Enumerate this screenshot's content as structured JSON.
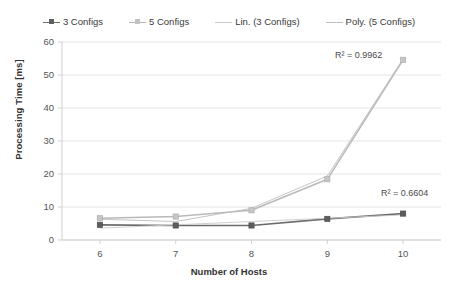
{
  "chart_data": {
    "type": "line",
    "title": "",
    "xlabel": "Number of Hosts",
    "ylabel": "Processing Time [ms]",
    "x": [
      6,
      7,
      8,
      9,
      10
    ],
    "xtick_labels": [
      "6",
      "7",
      "8",
      "9",
      "10"
    ],
    "ytick_labels": [
      "0",
      "10",
      "20",
      "30",
      "40",
      "50",
      "60"
    ],
    "xlim": [
      5.5,
      10.5
    ],
    "ylim": [
      0,
      60
    ],
    "grid": "horizontal",
    "legend_position": "top",
    "series": [
      {
        "name": "3 Configs",
        "kind": "data",
        "marker": "square",
        "color": "#6b6b6b",
        "values": [
          4.6,
          4.4,
          4.4,
          6.4,
          8.0
        ]
      },
      {
        "name": "5 Configs",
        "kind": "data",
        "marker": "square",
        "color": "#b9b9b9",
        "values": [
          6.6,
          7.1,
          9.0,
          18.4,
          54.6
        ]
      },
      {
        "name": "Lin. (3 Configs)",
        "kind": "trendline",
        "style": "solid-thin",
        "color": "#c9c9c9",
        "values": [
          3.6,
          4.6,
          5.6,
          6.6,
          7.6
        ],
        "r2_label": "R² = 0.6604"
      },
      {
        "name": "Poly. (5 Configs)",
        "kind": "trendline",
        "style": "solid-thin",
        "color": "#bdbdbd",
        "values": [
          6.3,
          5.6,
          9.6,
          19.4,
          54.9
        ],
        "r2_label": "R² = 0.9962"
      }
    ],
    "annotations": [
      {
        "text": "R² = 0.9962",
        "x_px": 335,
        "y_px": 50
      },
      {
        "text": "R² = 0.6604",
        "x_px": 381,
        "y_px": 188
      }
    ]
  },
  "legend": {
    "items": [
      {
        "label": "3 Configs",
        "swatch": "line-marker-dark"
      },
      {
        "label": "5 Configs",
        "swatch": "line-marker-light"
      },
      {
        "label": "Lin. (3 Configs)",
        "swatch": "line-plain-light"
      },
      {
        "label": "Poly. (5 Configs)",
        "swatch": "line-plain-light"
      }
    ]
  },
  "axes": {
    "y_title": "Processing Time [ms]",
    "x_title": "Number of Hosts",
    "y_ticks": [
      "60",
      "50",
      "40",
      "30",
      "20",
      "10",
      "0"
    ],
    "x_ticks": [
      "6",
      "7",
      "8",
      "9",
      "10"
    ]
  },
  "colors": {
    "series_dark": "#6b6b6b",
    "series_light": "#b9b9b9",
    "trend_light": "#c4c4c4",
    "gridline": "#e4e4e4",
    "axis": "#d0d0d0",
    "text": "#444444"
  }
}
